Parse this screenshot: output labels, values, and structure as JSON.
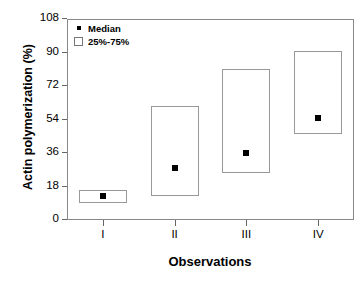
{
  "chart_data": {
    "type": "bar",
    "title": "",
    "xlabel": "Observations",
    "ylabel": "Actin polymerization (%)",
    "categories": [
      "I",
      "II",
      "III",
      "IV"
    ],
    "xtick_labels": [
      "I",
      "II",
      "III",
      "IV"
    ],
    "ytick_labels": [
      "0",
      "18",
      "36",
      "54",
      "72",
      "90",
      "108"
    ],
    "ytick_values": [
      0,
      18,
      36,
      54,
      72,
      90,
      108
    ],
    "ylim": [
      0,
      108
    ],
    "grid": false,
    "legend_position": "upper-left",
    "legend": [
      {
        "label": "Median",
        "marker": "filled-square"
      },
      {
        "label": "25%-75%",
        "marker": "open-box"
      }
    ],
    "series": [
      {
        "name": "Median",
        "values": [
          13,
          28,
          36,
          55
        ]
      },
      {
        "name": "25%",
        "values": [
          9,
          13,
          25,
          46
        ]
      },
      {
        "name": "75%",
        "values": [
          16,
          61,
          81,
          91
        ]
      }
    ],
    "points": [
      {
        "category": "I",
        "median": 13,
        "q25": 9,
        "q75": 16
      },
      {
        "category": "II",
        "median": 28,
        "q25": 13,
        "q75": 61
      },
      {
        "category": "III",
        "median": 36,
        "q25": 25,
        "q75": 81
      },
      {
        "category": "IV",
        "median": 55,
        "q25": 46,
        "q75": 91
      }
    ],
    "colors": {
      "box_stroke": "#999999",
      "box_fill": "#ffffff",
      "median_marker": "#000000",
      "axis": "#888888",
      "text": "#000000",
      "background": "#ffffff"
    }
  }
}
